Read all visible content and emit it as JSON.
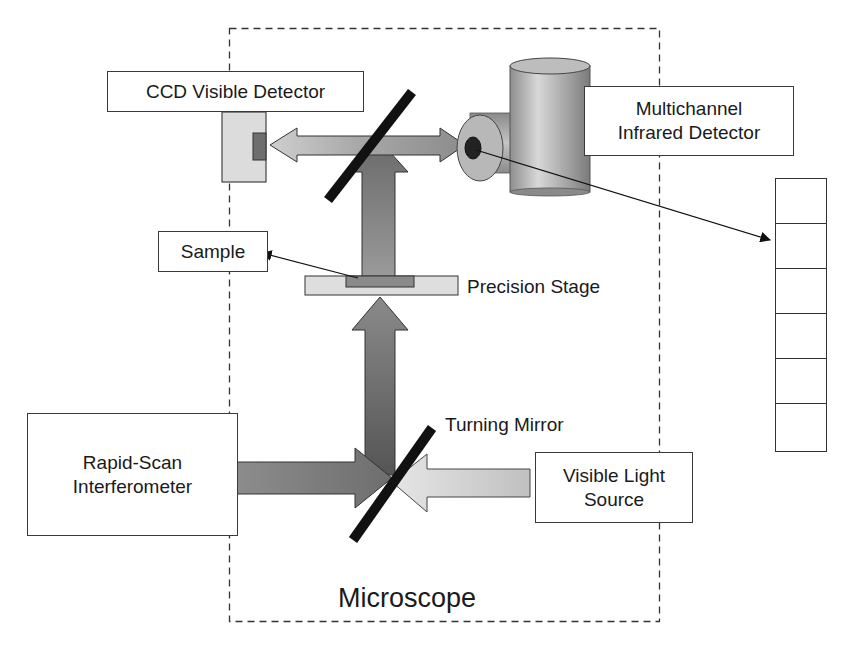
{
  "diagram": {
    "type": "optical schematic",
    "container": {
      "label": "Microscope",
      "style": "dashed"
    },
    "components": {
      "ccd_detector": {
        "label": "CCD Visible Detector"
      },
      "ir_detector": {
        "label_line1": "Multichannel",
        "label_line2": "Infrared Detector"
      },
      "sample": {
        "label": "Sample"
      },
      "stage": {
        "label": "Precision Stage"
      },
      "turning_mirror": {
        "label": "Turning Mirror"
      },
      "interferometer": {
        "label_line1": "Rapid-Scan",
        "label_line2": "Interferometer"
      },
      "light_source": {
        "label_line1": "Visible Light",
        "label_line2": "Source"
      },
      "detector_array": {
        "cells": 6
      }
    },
    "beams": [
      {
        "from": "Rapid-Scan Interferometer",
        "to": "Turning Mirror",
        "shade": "dark"
      },
      {
        "from": "Visible Light Source",
        "to": "Turning Mirror",
        "shade": "light"
      },
      {
        "from": "Turning Mirror",
        "to": "Sample",
        "direction": "up"
      },
      {
        "from": "Sample",
        "to": "Beamsplitter",
        "direction": "up"
      },
      {
        "from": "Beamsplitter",
        "to": "CCD Visible Detector",
        "direction": "left"
      },
      {
        "from": "Beamsplitter",
        "to": "Multichannel Infrared Detector",
        "direction": "right"
      }
    ],
    "colors": {
      "line": "#1a1a1a",
      "beam_dark": "#7a7a7a",
      "beam_light": "#c8c8c8",
      "mirror": "#111111",
      "stage_fill": "#dedede"
    }
  }
}
